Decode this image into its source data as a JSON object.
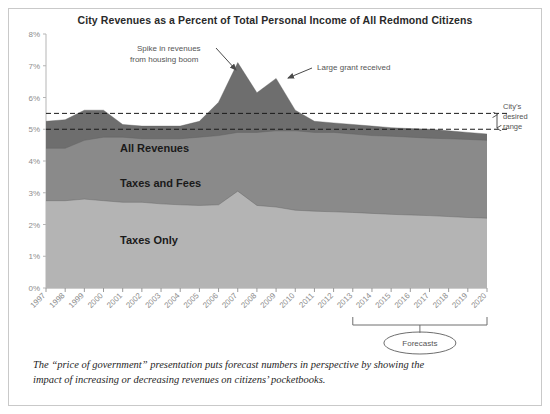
{
  "card": {
    "title": "City Revenues as a Percent of Total Personal Income of All Redmond Citizens",
    "caption_line1": "The “price of government” presentation puts forecast numbers in perspective by showing the",
    "caption_line2": "impact of increasing or decreasing revenues on citizens’ pocketbooks."
  },
  "annotations": {
    "spike_line1": "Spike in revenues",
    "spike_line2": "from housing boom",
    "grant": "Large grant received",
    "range_line1": "City’s",
    "range_line2": "desired",
    "range_line3": "range",
    "forecasts": "Forecasts"
  },
  "colors": {
    "all_revenues": "#6e6e6e",
    "taxes_and_fees": "#8a8a8a",
    "taxes_only": "#b4b4b4",
    "axis": "#9a9a9a",
    "border": "#c9c9c9",
    "text": "#2a2a2a"
  },
  "chart_data": {
    "type": "area",
    "title": "City Revenues as a Percent of Total Personal Income of All Redmond Citizens",
    "xlabel": "",
    "ylabel": "",
    "ylim": [
      0,
      8
    ],
    "ytick_labels": [
      "0%",
      "1%",
      "2%",
      "3%",
      "4%",
      "5%",
      "6%",
      "7%",
      "8%"
    ],
    "ytick_values": [
      0,
      1,
      2,
      3,
      4,
      5,
      6,
      7,
      8
    ],
    "grid": false,
    "legend": "inline-labels",
    "categories": [
      1997,
      1998,
      1999,
      2000,
      2001,
      2002,
      2003,
      2004,
      2005,
      2006,
      2007,
      2008,
      2009,
      2010,
      2011,
      2012,
      2013,
      2014,
      2015,
      2016,
      2017,
      2018,
      2019,
      2020
    ],
    "x": [
      "1997",
      "1998",
      "1999",
      "2000",
      "2001",
      "2002",
      "2003",
      "2004",
      "2005",
      "2006",
      "2007",
      "2008",
      "2009",
      "2010",
      "2011",
      "2012",
      "2013",
      "2014",
      "2015",
      "2016",
      "2017",
      "2018",
      "2019",
      "2020"
    ],
    "series": [
      {
        "name": "All Revenues",
        "color": "#6e6e6e",
        "stacking": "overlay-top",
        "values": [
          5.25,
          5.3,
          5.6,
          5.6,
          5.15,
          5.1,
          5.1,
          5.1,
          5.25,
          5.85,
          7.1,
          6.15,
          6.6,
          5.6,
          5.25,
          5.2,
          5.15,
          5.1,
          5.05,
          5.02,
          5.0,
          4.95,
          4.9,
          4.85
        ]
      },
      {
        "name": "Taxes and Fees",
        "color": "#8a8a8a",
        "stacking": "overlay-mid",
        "values": [
          4.4,
          4.4,
          4.65,
          4.75,
          4.75,
          4.7,
          4.7,
          4.7,
          4.75,
          4.8,
          4.9,
          4.9,
          4.95,
          4.95,
          4.9,
          4.9,
          4.85,
          4.8,
          4.78,
          4.75,
          4.72,
          4.7,
          4.68,
          4.65
        ]
      },
      {
        "name": "Taxes Only",
        "color": "#b4b4b4",
        "stacking": "overlay-bottom",
        "values": [
          2.75,
          2.75,
          2.8,
          2.75,
          2.7,
          2.7,
          2.65,
          2.62,
          2.6,
          2.62,
          3.05,
          2.6,
          2.55,
          2.45,
          2.42,
          2.4,
          2.38,
          2.35,
          2.32,
          2.3,
          2.28,
          2.25,
          2.22,
          2.2
        ]
      }
    ],
    "reference_lines": [
      {
        "label": "upper desired",
        "value": 5.5,
        "style": "dashed"
      },
      {
        "label": "lower desired",
        "value": 5.0,
        "style": "dashed"
      }
    ],
    "forecast_range": {
      "start": "2013",
      "end": "2020",
      "label": "Forecasts"
    },
    "callouts": [
      {
        "text": "Spike in revenues from housing boom",
        "target_x": "2007",
        "target_y": 7.1
      },
      {
        "text": "Large grant received",
        "target_x": "2009",
        "target_y": 6.6
      }
    ]
  }
}
